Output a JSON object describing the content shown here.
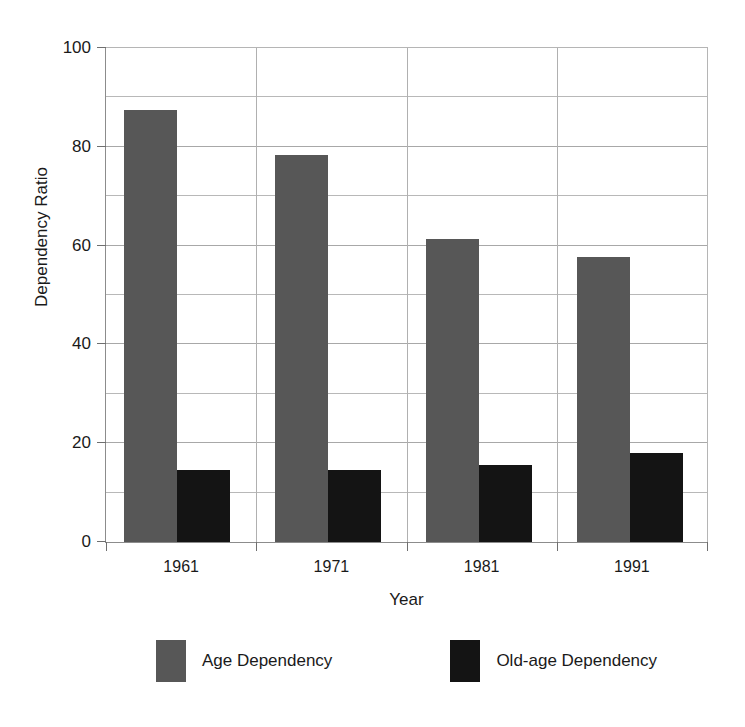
{
  "chart_data": {
    "type": "bar",
    "title": "",
    "xlabel": "Year",
    "ylabel": "Dependency Ratio",
    "categories": [
      "1961",
      "1971",
      "1981",
      "1991"
    ],
    "series": [
      {
        "name": "Age Dependency",
        "color": "#575757",
        "values": [
          87,
          78,
          61,
          57.5
        ]
      },
      {
        "name": "Old-age Dependency",
        "color": "#141414",
        "values": [
          14.5,
          14.5,
          15.5,
          18
        ]
      }
    ],
    "ylim": [
      0,
      100
    ],
    "ytick_labels": [
      "0",
      "20",
      "40",
      "60",
      "80",
      "100"
    ],
    "ytick_values": [
      0,
      20,
      40,
      60,
      80,
      100
    ],
    "ygrid_minor_values": [
      10,
      30,
      50,
      70,
      90
    ],
    "grid": true,
    "legend_position": "bottom"
  }
}
